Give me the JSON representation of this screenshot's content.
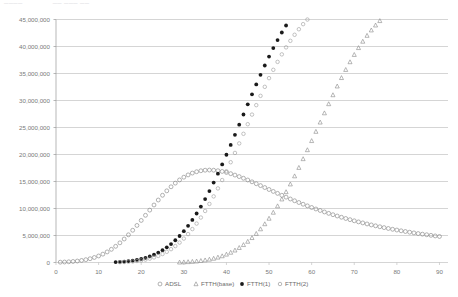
{
  "header": {
    "fragment_left": "────",
    "fragment_right": "── ─── ──"
  },
  "chart_data": {
    "type": "scatter",
    "title": "",
    "subtitle": "",
    "xlabel": "",
    "ylabel": "",
    "xlim": [
      0,
      92
    ],
    "ylim": [
      0,
      45000000
    ],
    "xticks": [
      0,
      10,
      20,
      30,
      40,
      50,
      60,
      70,
      80,
      90
    ],
    "yticks": [
      0,
      5000000,
      10000000,
      15000000,
      20000000,
      25000000,
      30000000,
      35000000,
      40000000,
      45000000
    ],
    "ytick_labels": [
      "0",
      "5,000,000",
      "10,000,000",
      "15,000,000",
      "20,000,000",
      "25,000,000",
      "30,000,000",
      "35,000,000",
      "40,000,000",
      "45,000,000"
    ],
    "xtick_labels": [
      "0",
      "10",
      "20",
      "30",
      "40",
      "50",
      "60",
      "70",
      "80",
      "90"
    ],
    "grid": "horizontal",
    "legend_position": "bottom",
    "series": [
      {
        "name": "ADSL",
        "marker": "open-circle",
        "color": "#888888",
        "points": [
          [
            1,
            60000
          ],
          [
            2,
            90000
          ],
          [
            3,
            130000
          ],
          [
            4,
            190000
          ],
          [
            5,
            270000
          ],
          [
            6,
            380000
          ],
          [
            7,
            520000
          ],
          [
            8,
            700000
          ],
          [
            9,
            930000
          ],
          [
            10,
            1210000
          ],
          [
            11,
            1550000
          ],
          [
            12,
            1960000
          ],
          [
            13,
            2440000
          ],
          [
            14,
            3000000
          ],
          [
            15,
            3640000
          ],
          [
            16,
            4350000
          ],
          [
            17,
            5130000
          ],
          [
            18,
            5970000
          ],
          [
            19,
            6860000
          ],
          [
            20,
            7790000
          ],
          [
            21,
            8740000
          ],
          [
            22,
            9700000
          ],
          [
            23,
            10650000
          ],
          [
            24,
            11570000
          ],
          [
            25,
            12450000
          ],
          [
            26,
            13270000
          ],
          [
            27,
            14020000
          ],
          [
            28,
            14700000
          ],
          [
            29,
            15290000
          ],
          [
            30,
            15800000
          ],
          [
            31,
            16220000
          ],
          [
            32,
            16560000
          ],
          [
            33,
            16810000
          ],
          [
            34,
            16990000
          ],
          [
            35,
            17090000
          ],
          [
            36,
            17120000
          ],
          [
            37,
            17090000
          ],
          [
            38,
            17000000
          ],
          [
            39,
            16860000
          ],
          [
            40,
            16680000
          ],
          [
            41,
            16450000
          ],
          [
            42,
            16190000
          ],
          [
            43,
            15910000
          ],
          [
            44,
            15600000
          ],
          [
            45,
            15280000
          ],
          [
            46,
            14940000
          ],
          [
            47,
            14590000
          ],
          [
            48,
            14240000
          ],
          [
            49,
            13880000
          ],
          [
            50,
            13520000
          ],
          [
            51,
            13160000
          ],
          [
            52,
            12800000
          ],
          [
            53,
            12450000
          ],
          [
            54,
            12100000
          ],
          [
            55,
            11760000
          ],
          [
            56,
            11430000
          ],
          [
            57,
            11110000
          ],
          [
            58,
            10790000
          ],
          [
            59,
            10490000
          ],
          [
            60,
            10190000
          ],
          [
            61,
            9910000
          ],
          [
            62,
            9630000
          ],
          [
            63,
            9360000
          ],
          [
            64,
            9100000
          ],
          [
            65,
            8850000
          ],
          [
            66,
            8610000
          ],
          [
            67,
            8380000
          ],
          [
            68,
            8150000
          ],
          [
            69,
            7930000
          ],
          [
            70,
            7720000
          ],
          [
            71,
            7520000
          ],
          [
            72,
            7330000
          ],
          [
            73,
            7140000
          ],
          [
            74,
            6960000
          ],
          [
            75,
            6790000
          ],
          [
            76,
            6620000
          ],
          [
            77,
            6460000
          ],
          [
            78,
            6300000
          ],
          [
            79,
            6150000
          ],
          [
            80,
            6010000
          ],
          [
            81,
            5870000
          ],
          [
            82,
            5740000
          ],
          [
            83,
            5610000
          ],
          [
            84,
            5480000
          ],
          [
            85,
            5360000
          ],
          [
            86,
            5250000
          ],
          [
            87,
            5140000
          ],
          [
            88,
            5030000
          ],
          [
            89,
            4920000
          ],
          [
            90,
            4820000
          ]
        ]
      },
      {
        "name": "FTTH(base)",
        "marker": "triangle",
        "color": "#8a8a8a",
        "points": [
          [
            29,
            40000
          ],
          [
            30,
            70000
          ],
          [
            31,
            110000
          ],
          [
            32,
            160000
          ],
          [
            33,
            230000
          ],
          [
            34,
            320000
          ],
          [
            35,
            430000
          ],
          [
            36,
            570000
          ],
          [
            37,
            740000
          ],
          [
            38,
            950000
          ],
          [
            39,
            1200000
          ],
          [
            40,
            1500000
          ],
          [
            41,
            1850000
          ],
          [
            42,
            2260000
          ],
          [
            43,
            2730000
          ],
          [
            44,
            3270000
          ],
          [
            45,
            3880000
          ],
          [
            46,
            4570000
          ],
          [
            47,
            5340000
          ],
          [
            48,
            6190000
          ],
          [
            49,
            7130000
          ],
          [
            50,
            8150000
          ],
          [
            51,
            9260000
          ],
          [
            52,
            10450000
          ],
          [
            53,
            11720000
          ],
          [
            54,
            13070000
          ],
          [
            55,
            14500000
          ],
          [
            56,
            16000000
          ],
          [
            57,
            17560000
          ],
          [
            58,
            19180000
          ],
          [
            59,
            20840000
          ],
          [
            60,
            22530000
          ],
          [
            61,
            24240000
          ],
          [
            62,
            25960000
          ],
          [
            63,
            27670000
          ],
          [
            64,
            29360000
          ],
          [
            65,
            31020000
          ],
          [
            66,
            32640000
          ],
          [
            67,
            34200000
          ],
          [
            68,
            35700000
          ],
          [
            69,
            37130000
          ],
          [
            70,
            38480000
          ],
          [
            71,
            39750000
          ],
          [
            72,
            40930000
          ],
          [
            73,
            42020000
          ],
          [
            74,
            43020000
          ],
          [
            75,
            43930000
          ],
          [
            76,
            44750000
          ],
          [
            77,
            45480000
          ],
          [
            78,
            46130000
          ],
          [
            79,
            46700000
          ],
          [
            80,
            47200000
          ],
          [
            81,
            47640000
          ],
          [
            82,
            48010000
          ],
          [
            83,
            48330000
          ],
          [
            84,
            48610000
          ],
          [
            85,
            48840000
          ],
          [
            86,
            49040000
          ],
          [
            87,
            49210000
          ],
          [
            88,
            49350000
          ]
        ]
      },
      {
        "name": "FTTH(1)",
        "marker": "filled-circle",
        "color": "#1a1a1a",
        "points": [
          [
            14,
            80000
          ],
          [
            15,
            120000
          ],
          [
            16,
            180000
          ],
          [
            17,
            260000
          ],
          [
            18,
            360000
          ],
          [
            19,
            490000
          ],
          [
            20,
            660000
          ],
          [
            21,
            870000
          ],
          [
            22,
            1130000
          ],
          [
            23,
            1450000
          ],
          [
            24,
            1830000
          ],
          [
            25,
            2280000
          ],
          [
            26,
            2810000
          ],
          [
            27,
            3420000
          ],
          [
            28,
            4120000
          ],
          [
            29,
            4910000
          ],
          [
            30,
            5800000
          ],
          [
            31,
            6790000
          ],
          [
            32,
            7880000
          ],
          [
            33,
            9070000
          ],
          [
            34,
            10360000
          ],
          [
            35,
            11750000
          ],
          [
            36,
            13230000
          ],
          [
            37,
            14800000
          ],
          [
            38,
            16450000
          ],
          [
            39,
            18170000
          ],
          [
            40,
            19950000
          ],
          [
            41,
            21780000
          ],
          [
            42,
            23640000
          ],
          [
            43,
            25520000
          ],
          [
            44,
            27410000
          ],
          [
            45,
            29290000
          ],
          [
            46,
            31150000
          ],
          [
            47,
            32980000
          ],
          [
            48,
            34760000
          ],
          [
            49,
            36480000
          ],
          [
            50,
            38130000
          ],
          [
            51,
            39700000
          ],
          [
            52,
            41190000
          ],
          [
            53,
            42590000
          ],
          [
            54,
            43890000
          ],
          [
            55,
            45100000
          ],
          [
            56,
            46210000
          ],
          [
            57,
            47230000
          ],
          [
            58,
            48150000
          ],
          [
            59,
            48980000
          ],
          [
            60,
            49720000
          ],
          [
            61,
            50380000
          ],
          [
            62,
            50960000
          ],
          [
            63,
            51470000
          ]
        ]
      },
      {
        "name": "FTTH(2)",
        "marker": "open-circle-small",
        "color": "#9a9a9a",
        "points": [
          [
            15,
            60000
          ],
          [
            16,
            90000
          ],
          [
            17,
            140000
          ],
          [
            18,
            200000
          ],
          [
            19,
            280000
          ],
          [
            20,
            390000
          ],
          [
            21,
            530000
          ],
          [
            22,
            710000
          ],
          [
            23,
            940000
          ],
          [
            24,
            1220000
          ],
          [
            25,
            1570000
          ],
          [
            26,
            1980000
          ],
          [
            27,
            2470000
          ],
          [
            28,
            3040000
          ],
          [
            29,
            3690000
          ],
          [
            30,
            4430000
          ],
          [
            31,
            5260000
          ],
          [
            32,
            6190000
          ],
          [
            33,
            7210000
          ],
          [
            34,
            8330000
          ],
          [
            35,
            9540000
          ],
          [
            36,
            10850000
          ],
          [
            37,
            12240000
          ],
          [
            38,
            13720000
          ],
          [
            39,
            15270000
          ],
          [
            40,
            16890000
          ],
          [
            41,
            18570000
          ],
          [
            42,
            20290000
          ],
          [
            43,
            22050000
          ],
          [
            44,
            23830000
          ],
          [
            45,
            25610000
          ],
          [
            46,
            27390000
          ],
          [
            47,
            29140000
          ],
          [
            48,
            30860000
          ],
          [
            49,
            32530000
          ],
          [
            50,
            34140000
          ],
          [
            51,
            35680000
          ],
          [
            52,
            37150000
          ],
          [
            53,
            38540000
          ],
          [
            54,
            39840000
          ],
          [
            55,
            41050000
          ],
          [
            56,
            42170000
          ],
          [
            57,
            43200000
          ],
          [
            58,
            44140000
          ],
          [
            59,
            44990000
          ],
          [
            60,
            45760000
          ],
          [
            61,
            46440000
          ],
          [
            62,
            47050000
          ],
          [
            63,
            47590000
          ],
          [
            64,
            48060000
          ],
          [
            65,
            48470000
          ],
          [
            66,
            48830000
          ],
          [
            67,
            49140000
          ],
          [
            68,
            49410000
          ],
          [
            69,
            49640000
          ],
          [
            70,
            49840000
          ],
          [
            71,
            50010000
          ],
          [
            72,
            50160000
          ],
          [
            73,
            50290000
          ],
          [
            74,
            50400000
          ]
        ]
      }
    ],
    "legend": [
      {
        "label": "ADSL",
        "marker": "open-circle"
      },
      {
        "label": "FTTH(base)",
        "marker": "triangle"
      },
      {
        "label": "FTTH(1)",
        "marker": "filled-circle"
      },
      {
        "label": "FTTH(2)",
        "marker": "open-circle-small"
      }
    ]
  }
}
